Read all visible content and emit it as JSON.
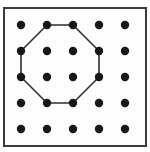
{
  "figure": {
    "name": "octagon-on-dot-grid",
    "canvas": {
      "width": 150,
      "height": 152,
      "background": "#ffffff"
    },
    "frame": {
      "x": 4,
      "y": 8,
      "width": 142,
      "height": 138,
      "stroke": "#3b3b3b",
      "stroke_width": 2,
      "fill": "#fdfdfd"
    },
    "grid": {
      "columns_x": [
        21,
        47,
        73,
        99,
        125
      ],
      "rows_y": [
        25,
        51,
        77,
        103,
        129
      ],
      "dot_radius": 4.2,
      "dot_color": "#171717"
    },
    "octagon": {
      "points": [
        [
          47,
          25
        ],
        [
          73,
          25
        ],
        [
          99,
          51
        ],
        [
          99,
          77
        ],
        [
          73,
          103
        ],
        [
          47,
          103
        ],
        [
          21,
          77
        ],
        [
          21,
          51
        ]
      ],
      "stroke": "#2d2d2d",
      "stroke_width": 1.6,
      "fill": "none"
    }
  }
}
